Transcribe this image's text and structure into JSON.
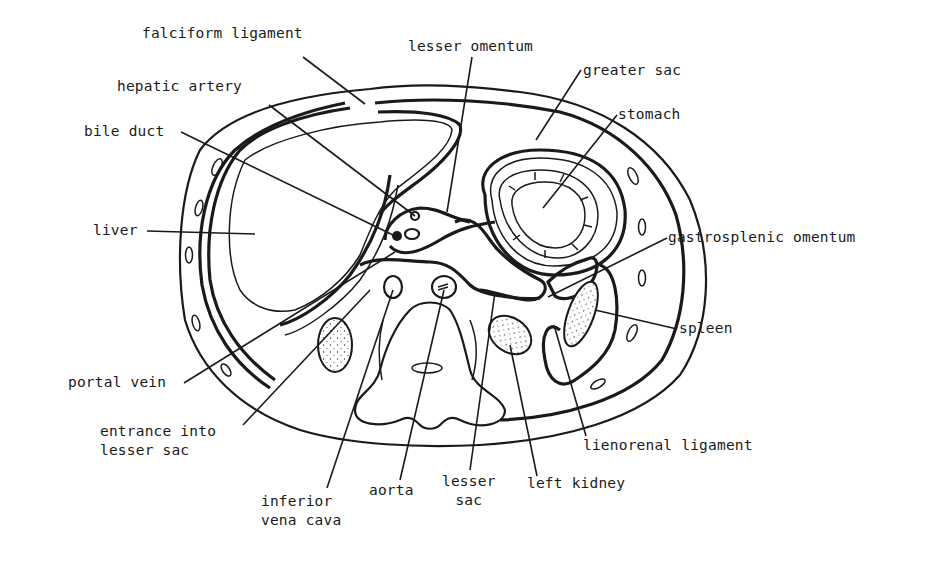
{
  "diagram": {
    "type": "anatomical cross-section",
    "ink_color": "#1a1a1a",
    "background_color": "#ffffff",
    "labels": [
      {
        "id": "falciform-ligament",
        "text": "falciform ligament",
        "x": 142,
        "y": 34,
        "leader_to": [
          365,
          104
        ]
      },
      {
        "id": "lesser-omentum",
        "text": "lesser omentum",
        "x": 408,
        "y": 37,
        "leader_to": [
          447,
          212
        ]
      },
      {
        "id": "greater-sac",
        "text": "greater sac",
        "x": 583,
        "y": 60,
        "leader_to": [
          536,
          140
        ]
      },
      {
        "id": "hepatic-artery",
        "text": "hepatic artery",
        "x": 117,
        "y": 80,
        "leader_to": [
          415,
          217
        ]
      },
      {
        "id": "stomach",
        "text": "stomach",
        "x": 619,
        "y": 105,
        "leader_to": [
          543,
          208
        ]
      },
      {
        "id": "bile-duct",
        "text": "bile duct",
        "x": 84,
        "y": 122,
        "leader_to": [
          395,
          236
        ]
      },
      {
        "id": "liver",
        "text": "liver",
        "x": 93,
        "y": 221,
        "leader_to": [
          255,
          234
        ]
      },
      {
        "id": "gastrosplenic-omentum",
        "text": "gastrosplenic omentum",
        "x": 669,
        "y": 228,
        "leader_to": [
          548,
          297
        ]
      },
      {
        "id": "spleen",
        "text": "spleen",
        "x": 679,
        "y": 322,
        "leader_to": [
          595,
          310
        ]
      },
      {
        "id": "portal-vein",
        "text": "portal vein",
        "x": 68,
        "y": 374,
        "leader_to": [
          395,
          252
        ]
      },
      {
        "id": "lienorenal-ligament",
        "text": "lienorenal ligament",
        "x": 583,
        "y": 436,
        "leader_to": [
          554,
          325
        ]
      },
      {
        "id": "entrance-into-lesser-sac",
        "text": "entrance into\nlesser sac",
        "x": 100,
        "y": 422,
        "leader_to": [
          370,
          290
        ]
      },
      {
        "id": "lesser-sac",
        "text": "lesser\nsac",
        "x": 442,
        "y": 472,
        "leader_to": [
          495,
          292
        ]
      },
      {
        "id": "left-kidney",
        "text": "left kidney",
        "x": 527,
        "y": 474,
        "leader_to": [
          510,
          345
        ]
      },
      {
        "id": "aorta",
        "text": "aorta",
        "x": 369,
        "y": 482,
        "leader_to": [
          444,
          290
        ]
      },
      {
        "id": "inferior-vena-cava",
        "text": "inferior\nvena cava",
        "x": 261,
        "y": 492,
        "leader_to": [
          393,
          290
        ]
      }
    ]
  }
}
